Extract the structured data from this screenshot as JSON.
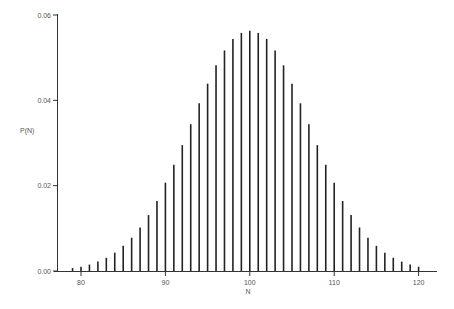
{
  "chart_data": {
    "type": "bar",
    "title": "",
    "xlabel": "N",
    "ylabel": "P(N)",
    "xlim": [
      77.5,
      122.5
    ],
    "ylim": [
      0,
      0.06
    ],
    "xticks": [
      80,
      90,
      100,
      110,
      120
    ],
    "xtick_labels": [
      "80",
      "90",
      "100",
      "110",
      "120"
    ],
    "yticks": [
      0.0,
      0.02,
      0.04,
      0.06
    ],
    "ytick_labels": [
      "0.00",
      "0.02",
      "0.04",
      "0.06"
    ],
    "grid": false,
    "legend": null,
    "categories": [
      79,
      80,
      81,
      82,
      83,
      84,
      85,
      86,
      87,
      88,
      89,
      90,
      91,
      92,
      93,
      94,
      95,
      96,
      97,
      98,
      99,
      100,
      101,
      102,
      103,
      104,
      105,
      106,
      107,
      108,
      109,
      110,
      111,
      112,
      113,
      114,
      115,
      116,
      117,
      118,
      119,
      120
    ],
    "values": [
      0.0007,
      0.001,
      0.0015,
      0.0022,
      0.0031,
      0.0043,
      0.0059,
      0.0078,
      0.0102,
      0.0131,
      0.0164,
      0.0207,
      0.0249,
      0.0295,
      0.0344,
      0.0393,
      0.0439,
      0.0482,
      0.0517,
      0.0544,
      0.0558,
      0.0563,
      0.0558,
      0.0544,
      0.0517,
      0.0482,
      0.0439,
      0.0393,
      0.0344,
      0.0295,
      0.0249,
      0.0207,
      0.0164,
      0.0131,
      0.0102,
      0.0078,
      0.0059,
      0.0043,
      0.0031,
      0.0022,
      0.0015,
      0.001
    ]
  }
}
